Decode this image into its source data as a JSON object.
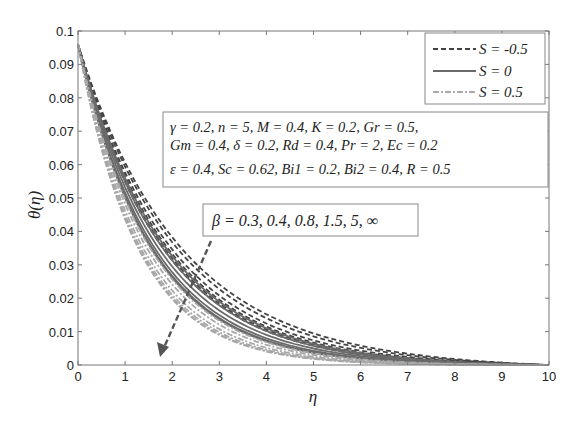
{
  "chart_data": {
    "type": "line",
    "title": "",
    "xlabel": "η",
    "ylabel": "θ(η)",
    "xlim": [
      0,
      10
    ],
    "ylim": [
      0,
      0.1
    ],
    "xticks": [
      "0",
      "1",
      "2",
      "3",
      "4",
      "5",
      "6",
      "7",
      "8",
      "9",
      "10"
    ],
    "yticks": [
      "0",
      "0.01",
      "0.02",
      "0.03",
      "0.04",
      "0.05",
      "0.06",
      "0.07",
      "0.08",
      "0.09",
      "0.1"
    ],
    "grid": false,
    "legend_position": "upper right",
    "legend": [
      {
        "label": "S = -0.5",
        "style": "dashed",
        "color": "#444444"
      },
      {
        "label": "S = 0",
        "style": "solid",
        "color": "#6a6a6a"
      },
      {
        "label": "S = 0.5",
        "style": "dashdot",
        "color": "#aaaaaa"
      }
    ],
    "parameter_box": [
      "γ = 0.2, n = 5, M = 0.4, K = 0.2, Gr = 0.5,",
      "Gm = 0.4, δ = 0.2, Rd = 0.4, Pr = 2, Ec = 0.2",
      "ε = 0.4, Sc = 0.62, Bi1 = 0.2, Bi2 = 0.4, R = 0.5"
    ],
    "annotation": "β = 0.3, 0.4, 0.8, 1.5, 5, ∞",
    "annotation_arrow": "direction of increasing β (θ decreases)",
    "theta_at_0": 0.096,
    "series": [
      {
        "name": "S=-0.5, β=0.3",
        "style": "dashed",
        "decay": 0.46
      },
      {
        "name": "S=-0.5, β=0.4",
        "style": "dashed",
        "decay": 0.48
      },
      {
        "name": "S=-0.5, β=0.8",
        "style": "dashed",
        "decay": 0.51
      },
      {
        "name": "S=-0.5, β=1.5",
        "style": "dashed",
        "decay": 0.53
      },
      {
        "name": "S=-0.5, β=5",
        "style": "dashed",
        "decay": 0.55
      },
      {
        "name": "S=-0.5, β=∞",
        "style": "dashed",
        "decay": 0.56
      },
      {
        "name": "S=0, β=0.3",
        "style": "solid",
        "decay": 0.54
      },
      {
        "name": "S=0, β=0.4",
        "style": "solid",
        "decay": 0.56
      },
      {
        "name": "S=0, β=0.8",
        "style": "solid",
        "decay": 0.59
      },
      {
        "name": "S=0, β=1.5",
        "style": "solid",
        "decay": 0.62
      },
      {
        "name": "S=0, β=5",
        "style": "solid",
        "decay": 0.64
      },
      {
        "name": "S=0, β=∞",
        "style": "solid",
        "decay": 0.65
      },
      {
        "name": "S=0.5, β=0.3",
        "style": "dashdot",
        "decay": 0.66
      },
      {
        "name": "S=0.5, β=0.4",
        "style": "dashdot",
        "decay": 0.69
      },
      {
        "name": "S=0.5, β=0.8",
        "style": "dashdot",
        "decay": 0.73
      },
      {
        "name": "S=0.5, β=1.5",
        "style": "dashdot",
        "decay": 0.76
      },
      {
        "name": "S=0.5, β=5",
        "style": "dashdot",
        "decay": 0.78
      },
      {
        "name": "S=0.5, β=∞",
        "style": "dashdot",
        "decay": 0.79
      }
    ]
  }
}
